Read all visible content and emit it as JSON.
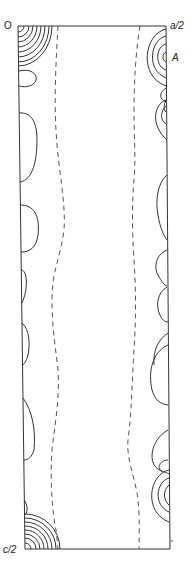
{
  "figure": {
    "type": "electron density contour map (projection)",
    "labels": {
      "origin": "O",
      "x_end": "a/2",
      "y_end": "c/2",
      "peak": "A"
    },
    "colors": {
      "line": "#333333",
      "dashed": "#555555",
      "background": "#ffffff"
    },
    "contour_styles": {
      "solid": "positive contours",
      "dashed": "zero contour"
    },
    "features": [
      {
        "name": "origin-peak",
        "location": "top-left corner",
        "rings": 9
      },
      {
        "name": "peak-A",
        "location": "right edge near top",
        "rings": 5
      },
      {
        "name": "bottom-left-peak",
        "location": "bottom-left corner",
        "rings": 10
      },
      {
        "name": "bottom-right-peak",
        "location": "right edge near bottom",
        "rings": 4
      },
      {
        "name": "zero-contour-left",
        "style": "dashed"
      },
      {
        "name": "zero-contour-right",
        "style": "dashed"
      }
    ]
  }
}
